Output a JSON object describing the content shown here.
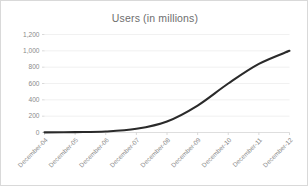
{
  "chart_data": {
    "type": "line",
    "title": "Users (in millions)",
    "xlabel": "",
    "ylabel": "",
    "categories": [
      "December-04",
      "December-05",
      "December-06",
      "December-07",
      "December-08",
      "December-09",
      "December-10",
      "December-11",
      "December-12"
    ],
    "values": [
      2,
      5,
      12,
      45,
      135,
      330,
      600,
      840,
      1000
    ],
    "series": [
      {
        "name": "Users (in millions)",
        "values": [
          2,
          5,
          12,
          45,
          135,
          330,
          600,
          840,
          1000
        ]
      }
    ],
    "ylim": [
      0,
      1200
    ],
    "yticks": [
      0,
      200,
      400,
      600,
      800,
      1000,
      1200
    ],
    "ytick_labels": [
      "0",
      "200",
      "400",
      "600",
      "800",
      "1,000",
      "1,200"
    ],
    "grid": true,
    "legend": false,
    "legend_position": "none",
    "xtick_rotation": 45,
    "line_color": "#2a2a2a",
    "line_width": 2.1,
    "grid_color": "#ededed",
    "axis_color": "#d6d6d6",
    "title_color": "#6e6e6e",
    "tick_label_color": "#8a8a8a",
    "background_color": "#ffffff",
    "border_color": "#d9d9d9"
  }
}
